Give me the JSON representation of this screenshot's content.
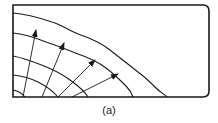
{
  "figure": {
    "caption": "(a)",
    "stroke_color": "#1a1a1a",
    "box": {
      "x": 13,
      "y": 5,
      "width": 196,
      "height": 92,
      "corner_radius": 6
    },
    "wavefronts": [
      {
        "name": "wavefront-1",
        "d": "M13,13 C28,14 40,18 52,22 C62,25 68,30 78,34 C90,38 100,42 110,50 C120,58 128,64 138,72 C146,78 150,82 156,88 C160,92 164,94 167,97"
      },
      {
        "name": "wavefront-2",
        "d": "M13,33 C26,34 36,38 46,42 C58,46 68,50 78,54 C90,58 98,62 106,68 C114,74 120,80 126,86 C130,90 132,94 133,97"
      },
      {
        "name": "wavefront-3",
        "d": "M13,56 C24,58 34,62 44,66 C54,70 62,74 70,80 C78,86 84,90 88,97"
      },
      {
        "name": "wavefront-4",
        "d": "M13,75 C22,76 30,78 38,82 C46,86 52,90 58,97"
      },
      {
        "name": "wavefront-5",
        "d": "M13,90 C18,91 22,93 25,97"
      }
    ],
    "rays": [
      {
        "name": "ray-1",
        "x1": 23,
        "y1": 97,
        "x2": 36,
        "y2": 30
      },
      {
        "name": "ray-2",
        "x1": 42,
        "y1": 97,
        "x2": 64,
        "y2": 43
      },
      {
        "name": "ray-3",
        "x1": 58,
        "y1": 97,
        "x2": 95,
        "y2": 60
      },
      {
        "name": "ray-4",
        "x1": 72,
        "y1": 97,
        "x2": 118,
        "y2": 74
      }
    ]
  }
}
